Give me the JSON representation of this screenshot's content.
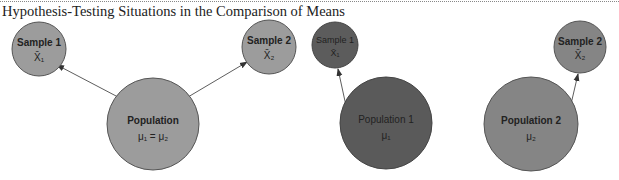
{
  "title": "Hypothesis-Testing Situations in the Comparison of Means",
  "colors": {
    "light_fill": "#9c9c9c",
    "dark_fill": "#5a5a5a",
    "mid_fill": "#858585",
    "stroke": "#555555",
    "arrow": "#333333"
  },
  "diagram_left": {
    "sample1": {
      "label": "Sample 1",
      "stat": "X̄₁"
    },
    "sample2": {
      "label": "Sample 2",
      "stat": "X̄₂"
    },
    "population": {
      "label": "Population",
      "param": "μ₁ = μ₂"
    }
  },
  "diagram_middle": {
    "sample1": {
      "label": "Sample 1",
      "stat": "X̄₁"
    },
    "population1": {
      "label": "Population 1",
      "param": "μ₁"
    }
  },
  "diagram_right": {
    "sample2": {
      "label": "Sample 2",
      "stat": "X̄₂"
    },
    "population2": {
      "label": "Population 2",
      "param": "μ₂"
    }
  }
}
